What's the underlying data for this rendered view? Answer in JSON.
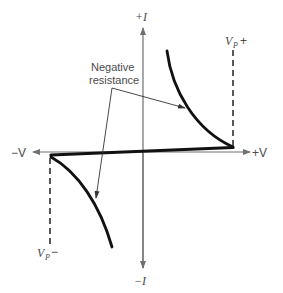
{
  "diagram": {
    "axes": {
      "plus_i_label": "+I",
      "minus_i_label": "−I",
      "plus_v_label": "+V",
      "minus_v_label": "−V"
    },
    "annotations": {
      "negative_resistance_line1": "Negative",
      "negative_resistance_line2": "resistance",
      "vp_plus_main": "V",
      "vp_plus_sub": "P",
      "vp_plus_sign": "+",
      "vp_minus_main": "V",
      "vp_minus_sub": "P",
      "vp_minus_sign": "−"
    },
    "colors": {
      "curve": "#111111",
      "axis": "#707070",
      "text": "#4a4a4a",
      "background": "#ffffff"
    }
  }
}
